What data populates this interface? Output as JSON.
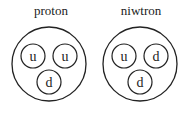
{
  "diagram": {
    "particles": [
      {
        "label": "proton",
        "center": [
          49,
          64
        ],
        "radius": 37,
        "quarks": [
          {
            "label": "u",
            "center": [
              33,
              56
            ],
            "radius": 12
          },
          {
            "label": "u",
            "center": [
              65,
              56
            ],
            "radius": 12
          },
          {
            "label": "d",
            "center": [
              49,
              82
            ],
            "radius": 12
          }
        ]
      },
      {
        "label": "niwtron",
        "center": [
          140,
          64
        ],
        "radius": 37,
        "quarks": [
          {
            "label": "u",
            "center": [
              124,
              56
            ],
            "radius": 12
          },
          {
            "label": "d",
            "center": [
              156,
              56
            ],
            "radius": 12
          },
          {
            "label": "d",
            "center": [
              140,
              82
            ],
            "radius": 12
          }
        ]
      }
    ],
    "colors": {
      "stroke": "#222222",
      "background": "#ffffff"
    }
  }
}
